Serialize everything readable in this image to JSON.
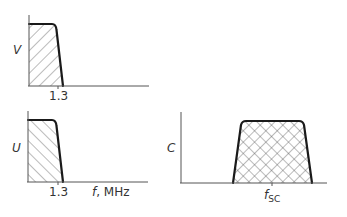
{
  "diagram": {
    "colors": {
      "curve": "#1a1a1a",
      "axis": "#555555",
      "hatch": "#555555",
      "text": "#333333",
      "background": "#ffffff"
    },
    "panels": [
      {
        "id": "V",
        "y_label": "V",
        "hatch": "forward-diagonal",
        "tick_label": "1.3",
        "x_label": ""
      },
      {
        "id": "U",
        "y_label": "U",
        "hatch": "backward-diagonal",
        "tick_label": "1.3",
        "x_label_main": "f",
        "x_label_unit": ", MHz"
      },
      {
        "id": "C",
        "y_label": "C",
        "hatch": "cross-hatch",
        "tick_label_main": "f",
        "tick_label_sub": "SC"
      }
    ]
  }
}
